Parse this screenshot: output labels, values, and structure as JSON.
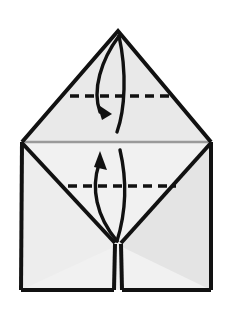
{
  "figure": {
    "title": "Origami fold step diagram",
    "caption": "",
    "background_color": "#ffffff",
    "outline_color": "#111111",
    "crease_color": "#9a9a9a",
    "paper_fill_light": "#f2f2f2",
    "paper_fill_mid": "#e6e6e6",
    "paper_fill_shade": "#dedede"
  },
  "chart_data": {
    "type": "diagram",
    "title": "Origami fold step diagram",
    "canvas": {
      "width": 231,
      "height": 310
    },
    "vertices": {
      "apex": [
        118,
        31
      ],
      "left_corner": [
        22,
        142
      ],
      "right_corner": [
        211,
        142
      ],
      "bottom_left": [
        21,
        290
      ],
      "bottom_right": [
        211,
        290
      ],
      "notch_point": [
        118,
        245
      ],
      "slit_bottom": [
        118,
        290
      ]
    },
    "shapes": [
      {
        "name": "upper-triangle-face",
        "points": "118,31 211,142 22,142",
        "fill": "#e9e9e9"
      },
      {
        "name": "lower-body-face",
        "points": "22,142 211,142 211,290 21,290",
        "fill": "#f1f1f1"
      },
      {
        "name": "lower-left-flap-face",
        "points": "22,142 118,245 21,290",
        "fill": "#ededed"
      },
      {
        "name": "lower-right-flap-face",
        "points": "211,142 211,290 118,245",
        "fill": "#e4e4e4"
      }
    ],
    "fold_lines": [
      {
        "name": "upper-fold-line",
        "style": "dashed",
        "y": 96,
        "x_start": 70,
        "x_end": 170,
        "dash": "9,6"
      },
      {
        "name": "lower-fold-line",
        "style": "dashed",
        "y": 186,
        "x_start": 68,
        "x_end": 176,
        "dash": "9,6"
      },
      {
        "name": "middle-crease-line",
        "style": "solid-gray",
        "y": 142,
        "x_start": 22,
        "x_end": 211
      }
    ],
    "arrows": [
      {
        "name": "upper-fold-arrow",
        "direction": "down",
        "meaning": "fold top point down to the dashed line",
        "path": "M 120,36 C 100,60 92,92 101,112",
        "return_path": "M 120,36 C 126,70 124,110 118,132",
        "head_at": [
          103,
          118
        ],
        "head_angle_deg": 110
      },
      {
        "name": "lower-fold-arrow",
        "direction": "up",
        "meaning": "fold bottom edge up to the dashed line",
        "path": "M 116,240 C 96,214 92,186 100,162",
        "return_path": "M 116,240 C 124,210 126,180 120,150",
        "head_at": [
          103,
          156
        ],
        "head_angle_deg": -75
      }
    ],
    "legend": [],
    "xlabel": "",
    "ylabel": ""
  }
}
